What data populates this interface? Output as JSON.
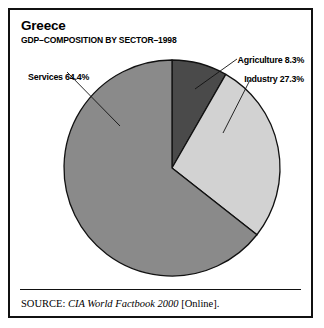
{
  "figure": {
    "title": "Greece",
    "subtitle": "GDP–COMPOSITION BY SECTOR–1998"
  },
  "source": {
    "label": "SOURCE:",
    "work": "CIA World Factbook 2000",
    "medium": "[Online]."
  },
  "labels": {
    "services": "Services 64.4%",
    "agriculture": "Agriculture 8.3%",
    "industry": "Industry 27.3%"
  },
  "chart_data": {
    "type": "pie",
    "title": "Greece",
    "subtitle": "GDP–COMPOSITION BY SECTOR–1998",
    "categories": [
      "Agriculture",
      "Industry",
      "Services"
    ],
    "values": [
      8.3,
      27.3,
      64.4
    ],
    "unit": "percent",
    "total": 100.0,
    "start_angle_deg": 0,
    "direction": "clockwise",
    "colors": [
      "#4a4a4a",
      "#d2d2d2",
      "#8a8a8a"
    ],
    "slice_labels": [
      "Agriculture 8.3%",
      "Industry 27.3%",
      "Services 64.4%"
    ],
    "legend": "external-leader-labels",
    "grid": false,
    "xlabel": "",
    "ylabel": ""
  },
  "geometry": {
    "center_x": 162,
    "center_y": 158,
    "radius": 108,
    "stroke": "#111111"
  }
}
